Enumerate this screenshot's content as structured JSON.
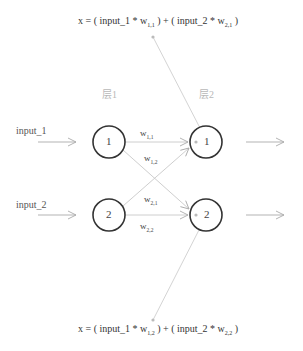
{
  "equations": {
    "top": {
      "prefix": "x = ( input_1 * w",
      "sub1": "1,1",
      "middle": " ) + ( input_2 * w",
      "sub2": "2,1",
      "suffix": " )"
    },
    "bottom": {
      "prefix": "x = ( input_1 * w",
      "sub1": "1,2",
      "middle": " ) + ( input_2 * w",
      "sub2": "2,2",
      "suffix": " )"
    }
  },
  "layers": [
    {
      "label": "层1",
      "nodes": [
        "1",
        "2"
      ]
    },
    {
      "label": "层2",
      "nodes": [
        "1",
        "2"
      ]
    }
  ],
  "inputs": [
    "input_1",
    "input_2"
  ],
  "weights": [
    {
      "base": "w",
      "sub": "1,1"
    },
    {
      "base": "w",
      "sub": "1,2"
    },
    {
      "base": "w",
      "sub": "2,1"
    },
    {
      "base": "w",
      "sub": "2,2"
    }
  ],
  "colors": {
    "node_stroke": "#333333",
    "edge": "#c8c8c8",
    "layer_label": "#b8b8b8"
  }
}
